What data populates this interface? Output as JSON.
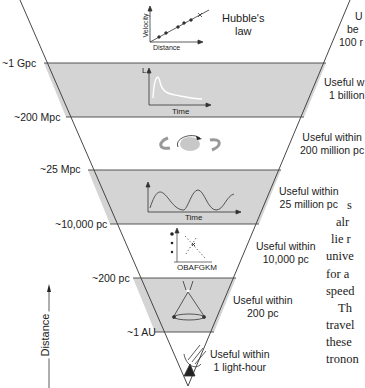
{
  "diagram": {
    "title_icon_label": "Hubble's law",
    "hubble_label_line1": "Hubble's",
    "hubble_label_line2": "law",
    "hubble_axis_x": "Distance",
    "hubble_axis_y": "Velocity",
    "distance_axis_label": "Distance",
    "levels": [
      {
        "scale": "~1 Gpc"
      },
      {
        "scale": "~200 Mpc"
      },
      {
        "scale": "~25 Mpc"
      },
      {
        "scale": "~10,000 pc"
      },
      {
        "scale": "~200 pc"
      },
      {
        "scale": "~1 AU"
      }
    ],
    "bands": [
      {
        "name": "hubble-law",
        "range_line1": "U",
        "range_line2": "be",
        "range_line3": "100 r"
      },
      {
        "name": "supernova-light-curve",
        "icon_axis_y": "L",
        "icon_axis_x": "Time",
        "range_line1": "Useful w",
        "range_line2": "1 billion"
      },
      {
        "name": "tully-fisher-galaxy-rotation",
        "range_line1": "Useful within",
        "range_line2": "200 million pc"
      },
      {
        "name": "cepheid-variables",
        "icon_axis_x": "Time",
        "range_line1": "Useful within",
        "range_line2": "25 million pc"
      },
      {
        "name": "main-sequence-fitting",
        "icon_axis_x": "OBAFGKM",
        "range_line1": "Useful within",
        "range_line2": "10,000 pc"
      },
      {
        "name": "stellar-parallax",
        "range_line1": "Useful within",
        "range_line2": "200 pc"
      },
      {
        "name": "radar-ranging",
        "range_line1": "Useful within",
        "range_line2": "1 light-hour"
      }
    ]
  },
  "body_text": {
    "lines": [
      "s",
      "alr",
      "lie r",
      "unive",
      "for a",
      "speed",
      "Th",
      "travel",
      "these",
      "tronon"
    ]
  }
}
